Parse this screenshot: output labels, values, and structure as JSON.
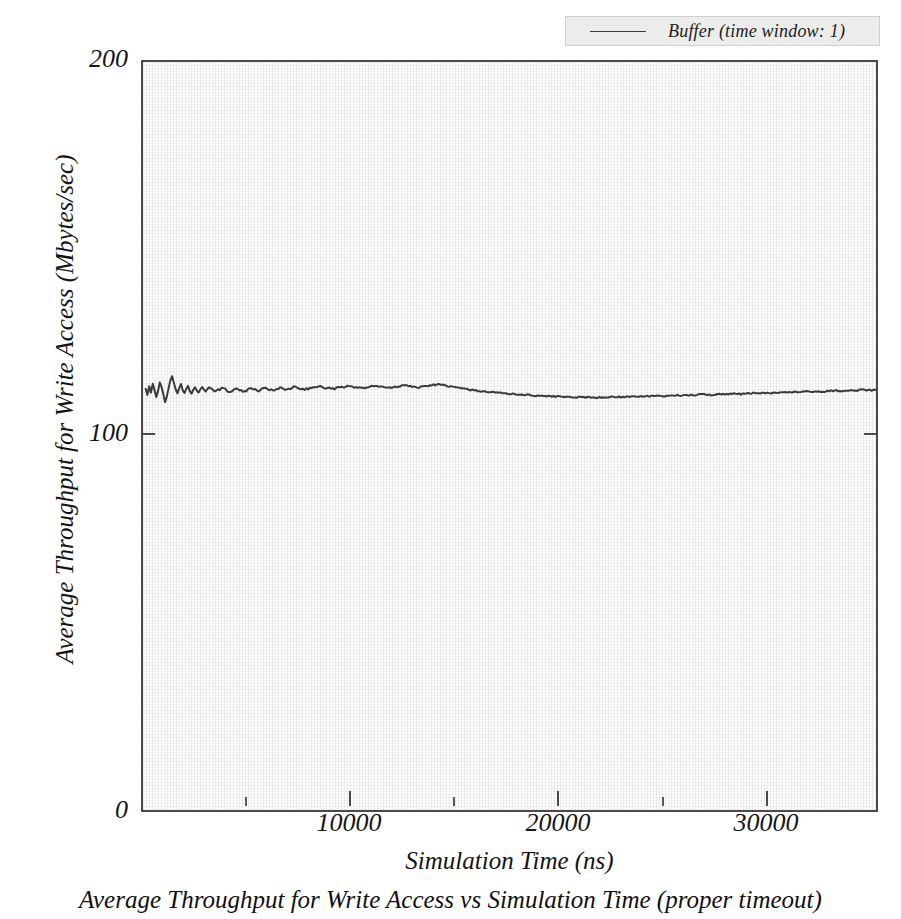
{
  "figure": {
    "caption": "Average Throughput for Write Access vs Simulation Time (proper timeout)"
  },
  "legend": {
    "position": "top-right",
    "entries": [
      {
        "label": "Buffer (time window: 1)",
        "color": "#3a3a3a"
      }
    ]
  },
  "axes": {
    "y_title": "Average Throughput for Write Access (Mbytes/sec)",
    "x_title": "Simulation Time (ns)",
    "y_ticks": [
      "200",
      "100",
      "0"
    ],
    "x_ticks": [
      "10000",
      "20000",
      "30000"
    ]
  },
  "chart_data": {
    "type": "line",
    "title": "Average Throughput for Write Access vs Simulation Time (proper timeout)",
    "xlabel": "Simulation Time (ns)",
    "ylabel": "Average Throughput for Write Access (Mbytes/sec)",
    "xlim": [
      0,
      33200
    ],
    "ylim": [
      0,
      200
    ],
    "xticks": [
      10000,
      20000,
      30000
    ],
    "xticks_minor": [
      5000,
      15000,
      25000
    ],
    "yticks": [
      0,
      100,
      200
    ],
    "grid": false,
    "legend_position": "top-right",
    "series": [
      {
        "name": "Buffer (time window: 1)",
        "color": "#3a3a3a",
        "x": [
          120,
          200,
          280,
          360,
          440,
          520,
          600,
          680,
          760,
          840,
          920,
          1000,
          1080,
          1160,
          1240,
          1320,
          1400,
          1480,
          1560,
          1640,
          1720,
          1800,
          1880,
          1960,
          2040,
          2120,
          2200,
          2280,
          2360,
          2440,
          2520,
          2600,
          2680,
          2760,
          2840,
          2920,
          3000,
          3160,
          3320,
          3480,
          3640,
          3800,
          3960,
          4120,
          4280,
          4440,
          4600,
          4760,
          4920,
          5080,
          5240,
          5400,
          5560,
          5720,
          5880,
          6040,
          6200,
          6360,
          6520,
          6680,
          6840,
          7000,
          7320,
          7640,
          7960,
          8280,
          8600,
          8920,
          9240,
          9560,
          9880,
          10200,
          10520,
          10840,
          11160,
          11480,
          11800,
          12120,
          12440,
          12760,
          13080,
          13400,
          13720,
          14040,
          14360,
          14680,
          15000,
          15400,
          15800,
          16200,
          16600,
          17000,
          17400,
          17800,
          18200,
          18600,
          19000,
          19400,
          19800,
          20200,
          20600,
          21000,
          21400,
          21800,
          22200,
          22600,
          23000,
          23400,
          23800,
          24200,
          24600,
          25000,
          25400,
          25800,
          26200,
          26600,
          27000,
          27400,
          27800,
          28200,
          28600,
          29000,
          29400,
          29800,
          30200,
          30600,
          31000,
          31400,
          31800,
          32200,
          32600,
          33000,
          33200
        ],
        "y": [
          112.6,
          111.0,
          113.3,
          111.6,
          114.0,
          112.3,
          110.4,
          112.0,
          114.3,
          113.1,
          111.2,
          109.0,
          110.6,
          112.8,
          114.9,
          116.0,
          114.2,
          112.5,
          111.4,
          112.8,
          113.9,
          112.2,
          111.5,
          112.6,
          113.4,
          112.0,
          111.3,
          112.4,
          113.0,
          112.1,
          111.6,
          112.5,
          113.1,
          112.4,
          111.9,
          112.6,
          113.0,
          112.4,
          112.0,
          112.5,
          112.8,
          112.2,
          111.8,
          112.3,
          112.7,
          112.2,
          111.9,
          112.4,
          112.8,
          112.3,
          112.0,
          112.5,
          112.9,
          112.4,
          112.1,
          112.6,
          113.0,
          112.6,
          112.3,
          112.7,
          113.1,
          112.8,
          112.5,
          112.9,
          113.2,
          112.9,
          112.6,
          113.0,
          113.3,
          113.0,
          112.8,
          113.1,
          113.4,
          113.1,
          112.9,
          113.2,
          113.5,
          113.3,
          113.0,
          113.3,
          113.6,
          113.8,
          113.4,
          113.1,
          112.8,
          112.5,
          112.2,
          111.9,
          111.7,
          111.5,
          111.3,
          111.1,
          111.0,
          110.8,
          110.7,
          110.6,
          110.5,
          110.4,
          110.4,
          110.3,
          110.3,
          110.4,
          110.5,
          110.4,
          110.6,
          110.5,
          110.7,
          110.6,
          110.8,
          110.9,
          110.8,
          111.0,
          111.1,
          111.0,
          111.2,
          111.3,
          111.2,
          111.4,
          111.5,
          111.4,
          111.6,
          111.7,
          111.6,
          111.8,
          111.9,
          111.8,
          112.0,
          112.1,
          112.0,
          112.2,
          112.3,
          112.2,
          112.3
        ]
      }
    ]
  }
}
